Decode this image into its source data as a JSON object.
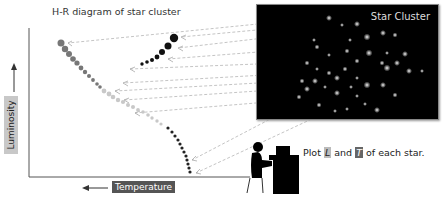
{
  "diagram": {
    "title": "H-R diagram of star cluster",
    "cluster_label": "Star Cluster",
    "y_axis_label": "Luminosity",
    "x_axis_label": "Temperature",
    "caption": {
      "prefix": "Plot ",
      "var_l": "L",
      "middle": " and ",
      "var_t": "T",
      "suffix": " of each star."
    },
    "icons": {
      "person": "person-at-computer-icon",
      "y_arrow": "arrow-up-icon",
      "x_arrow": "arrow-left-icon"
    },
    "colors": {
      "background": "#ffffff",
      "cluster_bg": "#000000",
      "main_sequence_upper": "#777777",
      "main_sequence_mid": "#c8c8c8",
      "main_sequence_lower": "#222222",
      "giant_branch": "#111111",
      "arrow_dash": "#aaaaaa"
    }
  }
}
